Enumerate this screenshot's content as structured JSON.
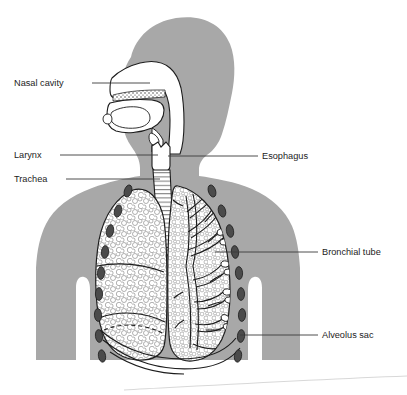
{
  "figure": {
    "background_color": "#ffffff",
    "body_fill_color": "#a8a8a8",
    "organ_fill_color": "#ffffff",
    "outline_color": "#1c1c1c",
    "rib_color": "#4b4b4b",
    "label_text_color": "#1c1c1c",
    "leader_line_color": "#3a3a3a"
  },
  "labels": [
    {
      "id": "nasal-cavity",
      "text": "Nasal cavity",
      "side": "left",
      "text_x": 14,
      "text_y": 86,
      "leader": {
        "x1": 92,
        "y1": 83,
        "x2": 150,
        "y2": 83
      }
    },
    {
      "id": "larynx",
      "text": "Larynx",
      "side": "left",
      "text_x": 14,
      "text_y": 158,
      "leader": {
        "x1": 60,
        "y1": 155,
        "x2": 158,
        "y2": 155
      }
    },
    {
      "id": "trachea",
      "text": "Trachea",
      "side": "left",
      "text_x": 14,
      "text_y": 182,
      "leader": {
        "x1": 66,
        "y1": 179,
        "x2": 160,
        "y2": 179
      }
    },
    {
      "id": "esophagus",
      "text": "Esophagus",
      "side": "right",
      "text_x": 262,
      "text_y": 159,
      "leader": {
        "x1": 168,
        "y1": 156,
        "x2": 258,
        "y2": 156
      }
    },
    {
      "id": "bronchial-tube",
      "text": "Bronchial tube",
      "side": "right",
      "text_x": 322,
      "text_y": 255,
      "leader": {
        "x1": 215,
        "y1": 252,
        "x2": 318,
        "y2": 252
      }
    },
    {
      "id": "alveolus-sac",
      "text": "Alveolus sac",
      "side": "right",
      "text_x": 322,
      "text_y": 338,
      "leader": {
        "x1": 240,
        "y1": 335,
        "x2": 318,
        "y2": 335
      }
    }
  ],
  "structures": {
    "head_and_torso": "gray silhouette of head in profile facing left with neck, shoulders and upper arms",
    "nasal_cavity": "white open airway cavity behind the nose with stippled hard palate",
    "oral_cavity": "white mouth cavity with tongue and epiglottis",
    "pharynx": "white vertical throat passage connecting nasal and oral cavity to larynx",
    "larynx": "white boxy voice box at top of trachea",
    "trachea": "vertical windpipe with horizontal cartilage ring striping",
    "bronchi": "two striped tubes branching left and right from trachea base",
    "left_lung": "lung on viewer left drawn with alveolar cellular texture and lobe fissure lines",
    "right_lung": "lung on viewer right drawn as branching bronchial tree with alveolar sacs",
    "ribs": "columns of dark oval rib cross-sections along both outer lung margins",
    "diaphragm": "curved lines sweeping below both lungs"
  },
  "artifacts": {
    "scan_line": "faint diagonal scanner edge line across the lower portion of the page"
  }
}
